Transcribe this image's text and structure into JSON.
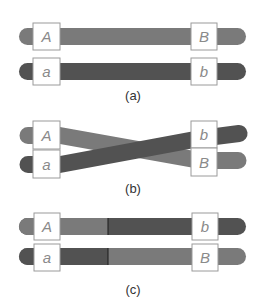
{
  "colors": {
    "light_chromosome": "#7a7a7a",
    "dark_chromosome": "#525252",
    "box_fill": "#ffffff",
    "box_stroke": "#9a9a9a",
    "label_text": "#8a8a8a"
  },
  "panels": [
    {
      "caption": "(a)",
      "top": {
        "left_allele": "A",
        "right_allele": "B"
      },
      "bottom": {
        "left_allele": "a",
        "right_allele": "b"
      }
    },
    {
      "caption": "(b)",
      "top": {
        "left_allele": "A",
        "right_allele": "b"
      },
      "bottom": {
        "left_allele": "a",
        "right_allele": "B"
      }
    },
    {
      "caption": "(c)",
      "top": {
        "left_allele": "A",
        "right_allele": "b"
      },
      "bottom": {
        "left_allele": "a",
        "right_allele": "B"
      }
    }
  ]
}
